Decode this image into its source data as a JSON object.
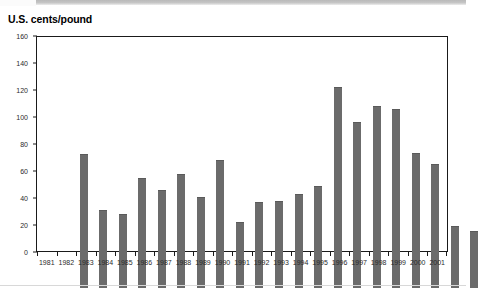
{
  "title": "U.S. cents/pound",
  "colors": {
    "bar": "#6b6b6b",
    "axis": "#1a1a1a",
    "text": "#2b2b2b",
    "background": "#ffffff",
    "top_strip": "#c6c6c6"
  },
  "chart_data": {
    "type": "bar",
    "title": "U.S. cents/pound",
    "xlabel": "",
    "ylabel": "U.S. cents/pound",
    "ylim": [
      0,
      160
    ],
    "yticks": [
      0,
      20,
      40,
      60,
      80,
      100,
      120,
      140,
      160
    ],
    "grid": false,
    "legend": false,
    "categories": [
      "1981",
      "1982",
      "1983",
      "1984",
      "1985",
      "1986",
      "1987",
      "1988",
      "1989",
      "1990",
      "1991",
      "1992",
      "1993",
      "1994",
      "1995",
      "1996",
      "1997",
      "1998",
      "1999",
      "2000",
      "2001"
    ],
    "values": [
      100,
      58,
      55,
      82,
      73,
      85,
      68,
      96,
      49,
      64,
      65,
      70,
      76,
      150,
      124,
      136,
      134,
      101,
      93,
      46,
      43
    ]
  }
}
